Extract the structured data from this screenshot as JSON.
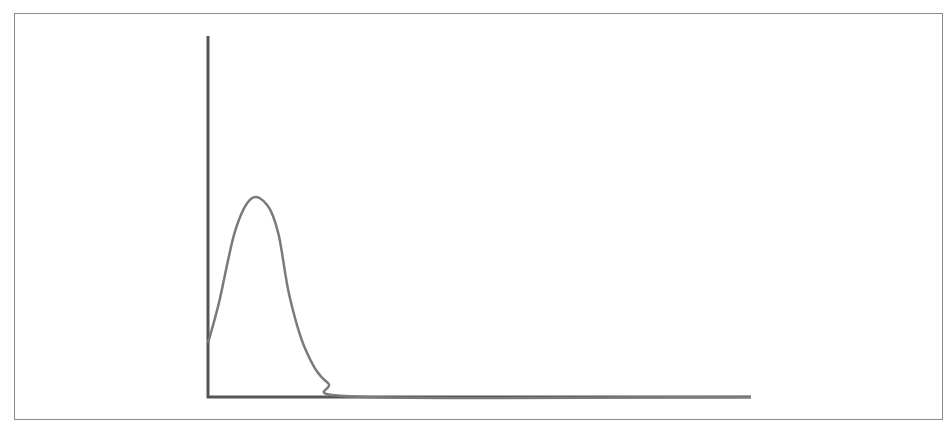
{
  "chart_data": {
    "type": "line",
    "title": "",
    "xlabel": "",
    "ylabel": "",
    "grid": false,
    "legend": null,
    "series": [
      {
        "name": "curve",
        "color": "#7a7a7a",
        "points": [
          {
            "x": 0.0,
            "y": 0.15
          },
          {
            "x": 0.02,
            "y": 0.26
          },
          {
            "x": 0.05,
            "y": 0.46
          },
          {
            "x": 0.08,
            "y": 0.55
          },
          {
            "x": 0.11,
            "y": 0.53
          },
          {
            "x": 0.13,
            "y": 0.45
          },
          {
            "x": 0.15,
            "y": 0.28
          },
          {
            "x": 0.18,
            "y": 0.13
          },
          {
            "x": 0.22,
            "y": 0.04
          },
          {
            "x": 0.29,
            "y": 0.0
          },
          {
            "x": 1.0,
            "y": 0.0
          }
        ]
      }
    ]
  },
  "colors": {
    "axis": "#555555",
    "curve": "#7a7a7a",
    "frame": "#8a8a8a"
  }
}
